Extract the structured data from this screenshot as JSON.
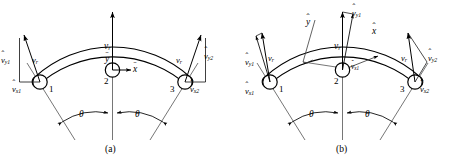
{
  "figure": {
    "type": "engineering-diagram",
    "background_color": "#ffffff",
    "stroke_color": "#000000",
    "panels": [
      {
        "id": "a",
        "caption": "(a)",
        "coordinate_system": "global-barred",
        "axes": [
          {
            "name": "x-bar-axis",
            "symbol": "x",
            "accent": "ˉ",
            "direction": "right-horizontal"
          },
          {
            "name": "y-bar-axis",
            "symbol": "y",
            "accent": "ˉ",
            "direction": "up-vertical"
          }
        ],
        "nodes": [
          {
            "id": "1",
            "label": "1",
            "position": "left"
          },
          {
            "id": "2",
            "label": "2",
            "position": "center"
          },
          {
            "id": "3",
            "label": "3",
            "position": "right"
          }
        ],
        "vectors": [
          {
            "name": "v-r-left",
            "symbol": "v",
            "sub": "r",
            "accent": ""
          },
          {
            "name": "v-r-center",
            "symbol": "v",
            "sub": "r",
            "accent": ""
          },
          {
            "name": "v-r-right",
            "symbol": "v",
            "sub": "r",
            "accent": ""
          },
          {
            "name": "v-hat-y1",
            "symbol": "v",
            "sub": "y1",
            "accent": "ˆ"
          },
          {
            "name": "v-hat-x1",
            "symbol": "v",
            "sub": "x1",
            "accent": "ˆ"
          },
          {
            "name": "v-hat-y2",
            "symbol": "v",
            "sub": "y2",
            "accent": "ˆ"
          },
          {
            "name": "v-hat-x2",
            "symbol": "v",
            "sub": "x2",
            "accent": "ˆ"
          }
        ],
        "angles": [
          {
            "name": "theta-left",
            "symbol": "θ"
          },
          {
            "name": "theta-right",
            "symbol": "θ"
          }
        ]
      },
      {
        "id": "b",
        "caption": "(b)",
        "coordinate_system": "local-hatted-rotated",
        "axes": [
          {
            "name": "x-hat-axis",
            "symbol": "x",
            "accent": "ˆ",
            "direction": "tangent-up-right"
          },
          {
            "name": "y-hat-axis",
            "symbol": "y",
            "accent": "ˆ",
            "direction": "normal-up-left"
          }
        ],
        "nodes": [
          {
            "id": "1",
            "label": "1",
            "position": "left"
          },
          {
            "id": "2",
            "label": "2",
            "position": "center"
          },
          {
            "id": "3",
            "label": "3",
            "position": "right"
          }
        ],
        "vectors": [
          {
            "name": "v-r-left",
            "symbol": "v",
            "sub": "r",
            "accent": ""
          },
          {
            "name": "v-r-center",
            "symbol": "v",
            "sub": "r",
            "accent": ""
          },
          {
            "name": "v-r-right",
            "symbol": "v",
            "sub": "r",
            "accent": ""
          },
          {
            "name": "v-hat-y1-left",
            "symbol": "v",
            "sub": "y1",
            "accent": "ˆ"
          },
          {
            "name": "v-hat-x1-left",
            "symbol": "v",
            "sub": "x1",
            "accent": "ˆ"
          },
          {
            "name": "v-hat-y1-center",
            "symbol": "v",
            "sub": "y1",
            "accent": "ˆ"
          },
          {
            "name": "v-hat-x1-center",
            "symbol": "v",
            "sub": "x1",
            "accent": "ˆ"
          },
          {
            "name": "v-hat-y2",
            "symbol": "v",
            "sub": "y2",
            "accent": "ˆ"
          },
          {
            "name": "v-hat-x2",
            "symbol": "v",
            "sub": "x2",
            "accent": "ˆ"
          }
        ],
        "angles": [
          {
            "name": "theta-left",
            "symbol": "θ"
          },
          {
            "name": "theta-right",
            "symbol": "θ"
          }
        ]
      }
    ],
    "labels": {
      "v": "v",
      "x": "x",
      "y": "y",
      "theta": "θ",
      "hat": "ˆ",
      "bar": "ˉ",
      "sub_r": "r",
      "sub_x1": "x1",
      "sub_y1": "y1",
      "sub_x2": "x2",
      "sub_y2": "y2",
      "node1": "1",
      "node2": "2",
      "node3": "3",
      "caption_a": "(a)",
      "caption_b": "(b)"
    }
  }
}
